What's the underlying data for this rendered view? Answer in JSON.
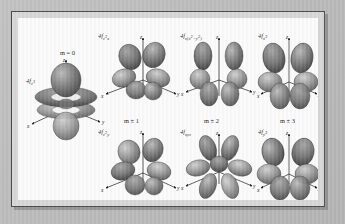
{
  "figure": {
    "kind": "atomic-orbital-plate",
    "background_color": "#b9b9b9",
    "frame_color": "#4a4a4a",
    "plate_color": "#fbfbfb",
    "lobe_color": "#6e6e6e",
    "axis_color": "#1a1a1a"
  },
  "axes": {
    "x": "x",
    "y": "y",
    "z": "z"
  },
  "groups": [
    {
      "id": "m0",
      "label_prefix": "m",
      "label": "m = 0"
    },
    {
      "id": "m1",
      "label_prefix": "m",
      "label": "m ± 1"
    },
    {
      "id": "m2",
      "label_prefix": "m",
      "label": "m ± 2"
    },
    {
      "id": "m3",
      "label_prefix": "m",
      "label": "m ± 3"
    }
  ],
  "orbitals": [
    {
      "id": "fz3",
      "shell": "4f",
      "sub": "z",
      "sup": "3",
      "label": "4fz3",
      "group": "m = 0",
      "row": "center",
      "column": 0
    },
    {
      "id": "fz2x",
      "shell": "4f",
      "sub": "z2x",
      "sup": "",
      "label": "4fz2x",
      "group": "m ± 1",
      "row": "top",
      "column": 1
    },
    {
      "id": "fz2y",
      "shell": "4f",
      "sub": "z2y",
      "sup": "",
      "label": "4fz2y",
      "group": "m ± 1",
      "row": "bottom",
      "column": 1
    },
    {
      "id": "fzx2y2",
      "shell": "4f",
      "sub": "z(x2-y2)",
      "sup": "",
      "label": "4fz(x2-y2)",
      "group": "m ± 2",
      "row": "top",
      "column": 2
    },
    {
      "id": "fxyz",
      "shell": "4f",
      "sub": "xyz",
      "sup": "",
      "label": "4fxyz",
      "group": "m ± 2",
      "row": "bottom",
      "column": 2
    },
    {
      "id": "fx3",
      "shell": "4f",
      "sub": "x",
      "sup": "3",
      "label": "4fx3",
      "group": "m ± 3",
      "row": "top",
      "column": 3
    },
    {
      "id": "fy3",
      "shell": "4f",
      "sub": "y",
      "sup": "3",
      "label": "4fy3",
      "group": "m ± 3",
      "row": "bottom",
      "column": 3
    }
  ]
}
